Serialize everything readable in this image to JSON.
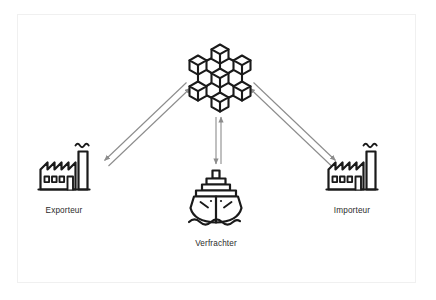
{
  "diagram": {
    "type": "blockchain-trade-flow",
    "language": "de",
    "background_color": "#ffffff",
    "frame_color": "#f0f0f0",
    "icon_color": "#1a1a1a",
    "arrow_color": "#8c8c8c",
    "label_color": "#2b2b2b",
    "nodes": [
      {
        "id": "blockchain",
        "icon": "blockchain-network-cubes-icon",
        "label": "",
        "cube_count": 7
      },
      {
        "id": "exporter",
        "icon": "factory-icon",
        "label": "Exporteur"
      },
      {
        "id": "carrier",
        "icon": "cargo-ship-icon",
        "label": "Verfrachter"
      },
      {
        "id": "importer",
        "icon": "factory-icon",
        "label": "Importeur"
      }
    ],
    "connectors": [
      {
        "id": "exporter-blockchain",
        "from": "exporter",
        "to": "blockchain",
        "style": "double-line-bidirectional",
        "arrowheads": "both"
      },
      {
        "id": "carrier-blockchain",
        "from": "carrier",
        "to": "blockchain",
        "style": "double-line-bidirectional",
        "arrowheads": "both"
      },
      {
        "id": "importer-blockchain",
        "from": "importer",
        "to": "blockchain",
        "style": "double-line-bidirectional",
        "arrowheads": "both"
      }
    ]
  }
}
